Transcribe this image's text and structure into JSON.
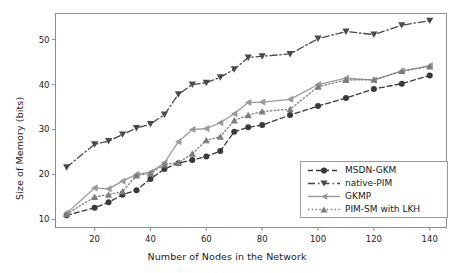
{
  "chart_data": {
    "type": "line",
    "title": "",
    "xlabel": "Number of Nodes in the Network",
    "ylabel": "Size of Memory (bits)",
    "x": [
      10,
      20,
      25,
      30,
      35,
      40,
      45,
      50,
      55,
      60,
      65,
      70,
      75,
      80,
      90,
      100,
      110,
      120,
      130,
      140
    ],
    "xlim": [
      6,
      146
    ],
    "ylim": [
      8.2,
      55.8
    ],
    "xticks": [
      20,
      40,
      60,
      80,
      100,
      120,
      140
    ],
    "yticks": [
      10,
      20,
      30,
      40,
      50
    ],
    "grid": false,
    "legend_position": "lower right",
    "series": [
      {
        "name": "MSDN-GKM",
        "color": "#3a3a3a",
        "marker": "circle",
        "linestyle": "dashed",
        "values": [
          10.9,
          12.6,
          13.8,
          15.5,
          16.5,
          19.0,
          21.2,
          22.5,
          23.2,
          24.0,
          25.2,
          29.5,
          30.5,
          31.0,
          33.2,
          35.2,
          37.0,
          39.0,
          40.2,
          42.0
        ]
      },
      {
        "name": "native-PIM",
        "color": "#4a4a4a",
        "marker": "triangle-down",
        "linestyle": "dashdot",
        "values": [
          21.6,
          26.7,
          27.4,
          28.9,
          30.3,
          31.2,
          33.3,
          37.8,
          40.0,
          40.4,
          41.6,
          43.4,
          46.0,
          46.3,
          46.8,
          50.2,
          51.8,
          51.1,
          53.2,
          54.2
        ]
      },
      {
        "name": "GKMP",
        "color": "#9a9a9a",
        "marker": "triangle-left",
        "linestyle": "solid",
        "values": [
          11.4,
          17.0,
          16.8,
          18.5,
          20.0,
          20.5,
          22.6,
          27.3,
          30.0,
          30.2,
          31.5,
          33.5,
          36.0,
          36.1,
          36.7,
          40.0,
          41.4,
          41.0,
          43.0,
          44.2
        ]
      },
      {
        "name": "PIM-SM with LKH",
        "color": "#7d7d7d",
        "marker": "triangle-up",
        "linestyle": "dotted",
        "values": [
          11.2,
          15.0,
          15.5,
          16.2,
          19.8,
          20.2,
          22.2,
          22.6,
          24.6,
          27.6,
          28.4,
          32.0,
          33.2,
          34.0,
          34.5,
          39.5,
          41.0,
          41.1,
          43.0,
          44.0
        ]
      }
    ]
  },
  "legend": {
    "items": [
      {
        "label": "MSDN-GKM"
      },
      {
        "label": "native-PIM"
      },
      {
        "label": "GKMP"
      },
      {
        "label": "PIM-SM with LKH"
      }
    ]
  },
  "axes": {
    "xlabel": "Number of Nodes in the Network",
    "ylabel": "Size of Memory (bits)",
    "xtick_labels": [
      "20",
      "40",
      "60",
      "80",
      "100",
      "120",
      "140"
    ],
    "ytick_labels": [
      "10",
      "20",
      "30",
      "40",
      "50"
    ]
  },
  "style": {
    "frame_color": "#8d8d8d",
    "background": "#ffffff"
  }
}
